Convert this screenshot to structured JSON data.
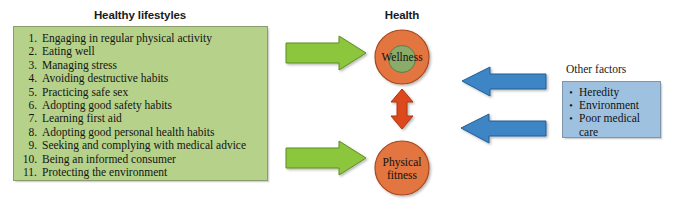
{
  "diagram": {
    "title_left": "Healthy lifestyles",
    "title_center": "Health",
    "title_right": "Other factors",
    "lifestyles": [
      {
        "num": "1.",
        "text": "Engaging in regular physical activity"
      },
      {
        "num": "2.",
        "text": "Eating well"
      },
      {
        "num": "3.",
        "text": "Managing stress"
      },
      {
        "num": "4.",
        "text": "Avoiding destructive habits"
      },
      {
        "num": "5.",
        "text": "Practicing safe sex"
      },
      {
        "num": "6.",
        "text": "Adopting good safety habits"
      },
      {
        "num": "7.",
        "text": "Learning first aid"
      },
      {
        "num": "8.",
        "text": "Adopting good personal health habits"
      },
      {
        "num": "9.",
        "text": "Seeking and complying with medical advice"
      },
      {
        "num": "10.",
        "text": "Being an informed consumer"
      },
      {
        "num": "11.",
        "text": "Protecting the environment"
      }
    ],
    "other_factors": [
      {
        "bullet": "•",
        "text": "Heredity"
      },
      {
        "bullet": "•",
        "text": "Environment"
      },
      {
        "bullet": "•",
        "text": "Poor medical"
      },
      {
        "bullet": "",
        "text": "care"
      }
    ],
    "nodes": {
      "wellness_line1": "Wellness",
      "fitness_line1": "Physical",
      "fitness_line2": "fitness"
    },
    "colors": {
      "lifestyles_box_fill": "#b5d18a",
      "lifestyles_box_border": "#8a9c6b",
      "other_factors_box_fill": "#9fc1e0",
      "other_factors_box_border": "#7e96ad",
      "green_arrow_fill": "#8cc63e",
      "green_arrow_border": "#5f8c22",
      "blue_arrow_fill": "#3c85c4",
      "blue_arrow_border": "#1f5e94",
      "red_arrow_fill": "#dd4a1c",
      "red_arrow_border": "#a83513",
      "circle_orange_fill": "#e2743f",
      "circle_orange_border": "#a8471c",
      "circle_green_fill": "#8aab6a",
      "circle_green_border": "#5f7d47",
      "text": "#141414"
    }
  }
}
